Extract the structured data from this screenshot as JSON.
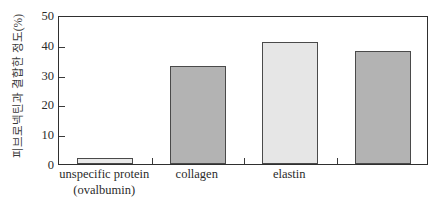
{
  "chart_data": {
    "type": "bar",
    "title": "",
    "xlabel": "",
    "ylabel": "피브로넥틴과 결합한 정도(%)",
    "ylim": [
      0,
      50
    ],
    "yticks": [
      0,
      10,
      20,
      30,
      40,
      50
    ],
    "grid": false,
    "legend": "none",
    "categories": [
      "unspecific protein\n(ovalbumin)",
      "collagen",
      "elastin",
      ""
    ],
    "values": [
      2,
      33,
      41,
      38
    ],
    "bars": [
      {
        "label_line1": "unspecific protein",
        "label_line2": "(ovalbumin)",
        "value": 2,
        "fill": "#e9e9e9"
      },
      {
        "label_line1": "collagen",
        "label_line2": "",
        "value": 33,
        "fill": "#b3b3b3"
      },
      {
        "label_line1": "elastin",
        "label_line2": "",
        "value": 41,
        "fill": "#e6e6e6"
      },
      {
        "label_line1": "",
        "label_line2": "",
        "value": 38,
        "fill": "#b3b3b3"
      }
    ],
    "axis_color": "#2f2f2f",
    "bar_edge_color": "#4a4a4a"
  }
}
